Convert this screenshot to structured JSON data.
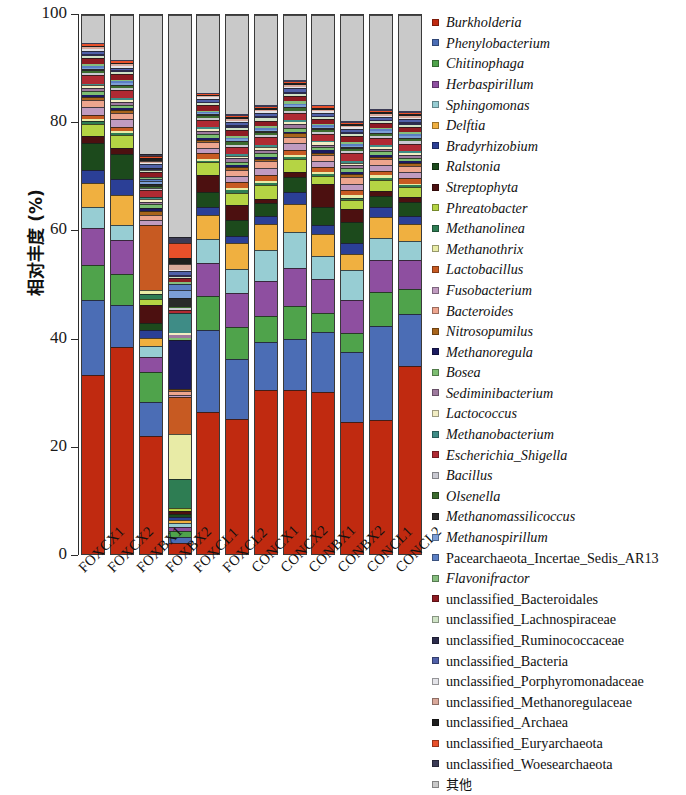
{
  "axes": {
    "y_title": "相对丰度 (%)",
    "y_ticks": [
      "0",
      "20",
      "40",
      "60",
      "80",
      "100"
    ],
    "y_min": 0,
    "y_max": 100
  },
  "chart_data": {
    "type": "bar",
    "title": "",
    "subtitle": "",
    "xlabel": "",
    "ylabel": "相对丰度 (%)",
    "ylim": [
      0,
      100
    ],
    "grid": false,
    "stacked": true,
    "legend_position": "right",
    "categories": [
      "FOXCX1",
      "FOXCX2",
      "FOXBX1",
      "FOXBX2",
      "FOXCL1",
      "FOXCL2",
      "CONCX1",
      "CONCX2",
      "CONBX1",
      "CONBX2",
      "CONCL1",
      "CONCL2"
    ],
    "series": [
      {
        "name": "Burkholderia",
        "color": "#C02A10",
        "values": [
          33.4,
          38.2,
          21.6,
          2.0,
          26.4,
          25.2,
          30.3,
          30.0,
          30.1,
          24.9,
          25.0,
          34.8
        ]
      },
      {
        "name": "Phenylobacterium",
        "color": "#4B6DB5",
        "values": [
          14.0,
          7.8,
          6.2,
          1.2,
          15.4,
          11.2,
          8.9,
          9.4,
          11.0,
          13.2,
          17.5,
          9.6
        ]
      },
      {
        "name": "Chitinophaga",
        "color": "#4FA34B",
        "values": [
          6.4,
          5.7,
          5.4,
          1.0,
          6.2,
          6.0,
          4.9,
          6.0,
          3.7,
          3.5,
          6.3,
          4.5
        ]
      },
      {
        "name": "Herbaspirillum",
        "color": "#8E4FA0",
        "values": [
          6.9,
          6.2,
          2.8,
          0.8,
          6.2,
          6.5,
          6.4,
          7.0,
          6.2,
          6.3,
          6.0,
          5.3
        ]
      },
      {
        "name": "Sphingomonas",
        "color": "#97CDD3",
        "values": [
          4.0,
          2.9,
          2.0,
          0.7,
          4.4,
          4.4,
          5.8,
          6.7,
          4.3,
          5.6,
          4.1,
          3.6
        ]
      },
      {
        "name": "Delftia",
        "color": "#F0B040",
        "values": [
          4.4,
          5.4,
          1.4,
          0.6,
          4.6,
          4.9,
          4.8,
          5.1,
          4.1,
          3.0,
          3.9,
          3.1
        ]
      },
      {
        "name": "Bradyrhizobium",
        "color": "#2B3F96",
        "values": [
          2.5,
          3.1,
          1.5,
          0.5,
          1.4,
          1.3,
          1.5,
          2.2,
          1.6,
          2.1,
          1.9,
          1.5
        ]
      },
      {
        "name": "Ralstonia",
        "color": "#1C4A1C",
        "values": [
          5.1,
          4.6,
          1.2,
          0.6,
          2.8,
          3.0,
          2.4,
          2.8,
          3.4,
          3.9,
          2.1,
          2.5
        ]
      },
      {
        "name": "Streptophyta",
        "color": "#4C1010",
        "values": [
          1.3,
          1.0,
          3.4,
          0.5,
          3.3,
          2.7,
          0.8,
          0.9,
          4.2,
          2.5,
          0.9,
          1.0
        ]
      },
      {
        "name": "Phreatobacter",
        "color": "#B5D444",
        "values": [
          2.2,
          2.4,
          1.1,
          0.5,
          2.3,
          2.4,
          2.5,
          2.3,
          1.6,
          1.7,
          2.1,
          1.8
        ]
      },
      {
        "name": "Methanolinea",
        "color": "#2E7D53",
        "values": [
          0.5,
          0.4,
          0.8,
          5.4,
          0.3,
          0.4,
          0.4,
          0.4,
          0.4,
          0.5,
          0.4,
          0.4
        ]
      },
      {
        "name": "Methanothrix",
        "color": "#E8EBA6",
        "values": [
          0.4,
          0.4,
          0.7,
          8.2,
          0.3,
          0.4,
          0.4,
          0.4,
          0.3,
          0.4,
          0.4,
          0.3
        ]
      },
      {
        "name": "Lactobacillus",
        "color": "#C75A22",
        "values": [
          0.8,
          0.8,
          11.9,
          6.8,
          1.1,
          1.1,
          1.0,
          0.9,
          1.0,
          1.0,
          0.9,
          1.0
        ]
      },
      {
        "name": "Fusobacterium",
        "color": "#C09BC0",
        "values": [
          1.5,
          1.4,
          1.0,
          0.5,
          1.0,
          1.2,
          1.4,
          1.3,
          1.0,
          1.2,
          1.1,
          1.2
        ]
      },
      {
        "name": "Bacteroides",
        "color": "#EDA58E",
        "values": [
          1.2,
          1.1,
          0.9,
          0.6,
          1.0,
          1.1,
          1.2,
          1.1,
          1.1,
          1.2,
          1.0,
          1.1
        ]
      },
      {
        "name": "Nitrosopumilus",
        "color": "#A8641B",
        "values": [
          0.6,
          0.5,
          0.7,
          0.5,
          0.5,
          0.6,
          0.5,
          0.6,
          0.5,
          0.6,
          0.5,
          0.5
        ]
      },
      {
        "name": "Methanoregula",
        "color": "#1B1B60",
        "values": [
          0.4,
          0.4,
          0.6,
          9.0,
          0.3,
          0.3,
          0.4,
          0.3,
          0.4,
          0.4,
          0.3,
          0.4
        ]
      },
      {
        "name": "Bosea",
        "color": "#7DBE72",
        "values": [
          0.7,
          0.7,
          0.6,
          0.4,
          0.7,
          0.7,
          0.7,
          0.8,
          0.6,
          0.7,
          0.7,
          0.6
        ]
      },
      {
        "name": "Sediminibacterium",
        "color": "#9E7A9E",
        "values": [
          0.6,
          0.5,
          0.5,
          0.4,
          0.6,
          0.6,
          0.6,
          0.6,
          0.5,
          0.6,
          0.5,
          0.5
        ]
      },
      {
        "name": "Lactococcus",
        "color": "#F2EDC3",
        "values": [
          0.5,
          0.4,
          0.4,
          0.4,
          0.4,
          0.5,
          0.5,
          0.4,
          0.4,
          0.5,
          0.4,
          0.4
        ]
      },
      {
        "name": "Methanobacterium",
        "color": "#3E8C86",
        "values": [
          0.3,
          0.3,
          0.5,
          3.7,
          0.3,
          0.3,
          0.3,
          0.3,
          0.3,
          0.3,
          0.3,
          0.3
        ]
      },
      {
        "name": "Escherichia_Shigella",
        "color": "#B02A33",
        "values": [
          1.6,
          1.5,
          1.2,
          0.6,
          1.4,
          1.4,
          1.5,
          1.4,
          1.3,
          1.5,
          1.3,
          1.4
        ]
      },
      {
        "name": "Bacillus",
        "color": "#C9C9D1",
        "values": [
          0.4,
          0.4,
          0.4,
          0.3,
          0.4,
          0.4,
          0.4,
          0.4,
          0.4,
          0.4,
          0.4,
          0.4
        ]
      },
      {
        "name": "Olsenella",
        "color": "#3C6B2E",
        "values": [
          0.4,
          0.3,
          0.4,
          0.3,
          0.4,
          0.4,
          0.4,
          0.4,
          0.3,
          0.4,
          0.3,
          0.4
        ]
      },
      {
        "name": "Methanomassilicoccus",
        "color": "#2A2A2A",
        "values": [
          0.3,
          0.3,
          0.4,
          1.6,
          0.2,
          0.3,
          0.3,
          0.3,
          0.3,
          0.3,
          0.3,
          0.3
        ]
      },
      {
        "name": "Methanospirillum",
        "color": "#7C9FD6",
        "values": [
          0.3,
          0.3,
          0.4,
          1.4,
          0.2,
          0.3,
          0.3,
          0.3,
          0.3,
          0.3,
          0.3,
          0.3
        ]
      },
      {
        "name": "Pacearchaeota_Incertae_Sedis_AR13",
        "color": "#5B7FC4",
        "values": [
          0.3,
          0.3,
          0.4,
          1.2,
          0.2,
          0.3,
          0.3,
          0.3,
          0.3,
          0.3,
          0.3,
          0.3
        ]
      },
      {
        "name": "Flavonifractor",
        "color": "#86BD7E",
        "values": [
          0.4,
          0.3,
          0.4,
          0.4,
          0.3,
          0.4,
          0.4,
          0.4,
          0.3,
          0.4,
          0.3,
          0.4
        ]
      },
      {
        "name": "unclassified_Bacteroidales",
        "color": "#8E1B22",
        "values": [
          1.1,
          1.0,
          0.9,
          0.6,
          1.0,
          1.1,
          1.0,
          1.0,
          0.9,
          1.1,
          0.9,
          1.0
        ]
      },
      {
        "name": "unclassified_Lachnospiraceae",
        "color": "#CFE3C6",
        "values": [
          0.4,
          0.4,
          0.4,
          0.3,
          0.4,
          0.4,
          0.4,
          0.4,
          0.3,
          0.4,
          0.3,
          0.4
        ]
      },
      {
        "name": "unclassified_Ruminococcaceae",
        "color": "#2C2C4C",
        "values": [
          0.4,
          0.3,
          0.4,
          0.4,
          0.3,
          0.4,
          0.4,
          0.4,
          0.3,
          0.4,
          0.3,
          0.4
        ]
      },
      {
        "name": "unclassified_Bacteria",
        "color": "#5060A8",
        "values": [
          0.6,
          0.5,
          0.6,
          0.6,
          0.5,
          0.6,
          0.6,
          0.6,
          0.5,
          0.6,
          0.5,
          0.6
        ]
      },
      {
        "name": "unclassified_Porphyromonadaceae",
        "color": "#E3E3E8",
        "values": [
          0.3,
          0.3,
          0.3,
          0.3,
          0.3,
          0.3,
          0.3,
          0.3,
          0.3,
          0.3,
          0.3,
          0.3
        ]
      },
      {
        "name": "unclassified_Methanoregulaceae",
        "color": "#D9A89A",
        "values": [
          0.3,
          0.3,
          0.4,
          1.0,
          0.2,
          0.3,
          0.3,
          0.3,
          0.3,
          0.3,
          0.3,
          0.3
        ]
      },
      {
        "name": "unclassified_Archaea",
        "color": "#1E1E1E",
        "values": [
          0.3,
          0.3,
          0.4,
          1.2,
          0.2,
          0.3,
          0.3,
          0.3,
          0.3,
          0.3,
          0.3,
          0.3
        ]
      },
      {
        "name": "unclassified_Euryarchaeota",
        "color": "#E8502A",
        "values": [
          0.3,
          0.3,
          0.4,
          2.8,
          0.2,
          0.3,
          0.3,
          0.3,
          0.3,
          0.3,
          0.3,
          0.3
        ]
      },
      {
        "name": "unclassified_Woesearchaeota",
        "color": "#3B3B55",
        "values": [
          0.3,
          0.3,
          0.4,
          1.0,
          0.2,
          0.3,
          0.3,
          0.3,
          0.3,
          0.3,
          0.3,
          0.3
        ]
      },
      {
        "name": "其他",
        "color": "#C9C9C9",
        "values": [
          5.1,
          8.2,
          25.3,
          40.8,
          14.5,
          18.5,
          16.6,
          11.9,
          16.6,
          19.9,
          17.5,
          17.7
        ]
      }
    ]
  },
  "legend": {
    "items": [
      {
        "label": "Burkholderia",
        "color": "#C02A10",
        "italic": true,
        "cjk": false
      },
      {
        "label": "Phenylobacterium",
        "color": "#4B6DB5",
        "italic": true,
        "cjk": false
      },
      {
        "label": "Chitinophaga",
        "color": "#4FA34B",
        "italic": true,
        "cjk": false
      },
      {
        "label": "Herbaspirillum",
        "color": "#8E4FA0",
        "italic": true,
        "cjk": false
      },
      {
        "label": "Sphingomonas",
        "color": "#97CDD3",
        "italic": true,
        "cjk": false
      },
      {
        "label": "Delftia",
        "color": "#F0B040",
        "italic": true,
        "cjk": false
      },
      {
        "label": "Bradyrhizobium",
        "color": "#2B3F96",
        "italic": true,
        "cjk": false
      },
      {
        "label": "Ralstonia",
        "color": "#1C4A1C",
        "italic": true,
        "cjk": false
      },
      {
        "label": "Streptophyta",
        "color": "#4C1010",
        "italic": true,
        "cjk": false
      },
      {
        "label": "Phreatobacter",
        "color": "#B5D444",
        "italic": true,
        "cjk": false
      },
      {
        "label": "Methanolinea",
        "color": "#2E7D53",
        "italic": true,
        "cjk": false
      },
      {
        "label": "Methanothrix",
        "color": "#E8EBA6",
        "italic": true,
        "cjk": false
      },
      {
        "label": "Lactobacillus",
        "color": "#C75A22",
        "italic": true,
        "cjk": false
      },
      {
        "label": "Fusobacterium",
        "color": "#C09BC0",
        "italic": true,
        "cjk": false
      },
      {
        "label": "Bacteroides",
        "color": "#EDA58E",
        "italic": true,
        "cjk": false
      },
      {
        "label": "Nitrosopumilus",
        "color": "#A8641B",
        "italic": true,
        "cjk": false
      },
      {
        "label": "Methanoregula",
        "color": "#1B1B60",
        "italic": true,
        "cjk": false
      },
      {
        "label": "Bosea",
        "color": "#7DBE72",
        "italic": true,
        "cjk": false
      },
      {
        "label": "Sediminibacterium",
        "color": "#9E7A9E",
        "italic": true,
        "cjk": false
      },
      {
        "label": "Lactococcus",
        "color": "#F2EDC3",
        "italic": true,
        "cjk": false
      },
      {
        "label": "Methanobacterium",
        "color": "#3E8C86",
        "italic": true,
        "cjk": false
      },
      {
        "label": "Escherichia_Shigella",
        "color": "#B02A33",
        "italic": true,
        "cjk": false
      },
      {
        "label": "Bacillus",
        "color": "#C9C9D1",
        "italic": true,
        "cjk": false
      },
      {
        "label": "Olsenella",
        "color": "#3C6B2E",
        "italic": true,
        "cjk": false
      },
      {
        "label": "Methanomassilicoccus",
        "color": "#2A2A2A",
        "italic": true,
        "cjk": false
      },
      {
        "label": "Methanospirillum",
        "color": "#7C9FD6",
        "italic": true,
        "cjk": false
      },
      {
        "label": "Pacearchaeota_Incertae_Sedis_AR13",
        "color": "#5B7FC4",
        "italic": false,
        "cjk": false
      },
      {
        "label": "Flavonifractor",
        "color": "#86BD7E",
        "italic": true,
        "cjk": false
      },
      {
        "label": "unclassified_Bacteroidales",
        "color": "#8E1B22",
        "italic": false,
        "cjk": false
      },
      {
        "label": "unclassified_Lachnospiraceae",
        "color": "#CFE3C6",
        "italic": false,
        "cjk": false
      },
      {
        "label": "unclassified_Ruminococcaceae",
        "color": "#2C2C4C",
        "italic": false,
        "cjk": false
      },
      {
        "label": "unclassified_Bacteria",
        "color": "#5060A8",
        "italic": false,
        "cjk": false
      },
      {
        "label": "unclassified_Porphyromonadaceae",
        "color": "#E3E3E8",
        "italic": false,
        "cjk": false
      },
      {
        "label": "unclassified_Methanoregulaceae",
        "color": "#D9A89A",
        "italic": false,
        "cjk": false
      },
      {
        "label": "unclassified_Archaea",
        "color": "#1E1E1E",
        "italic": false,
        "cjk": false
      },
      {
        "label": "unclassified_Euryarchaeota",
        "color": "#E8502A",
        "italic": false,
        "cjk": false
      },
      {
        "label": "unclassified_Woesearchaeota",
        "color": "#3B3B55",
        "italic": false,
        "cjk": false
      },
      {
        "label": "其他",
        "color": "#C9C9C9",
        "italic": false,
        "cjk": true
      }
    ]
  }
}
